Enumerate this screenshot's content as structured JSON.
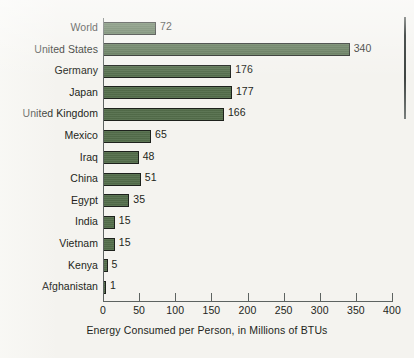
{
  "chart_data": {
    "type": "bar",
    "orientation": "horizontal",
    "title": "",
    "xlabel": "Energy Consumed per Person, in Millions of BTUs",
    "ylabel": "",
    "xlim": [
      0,
      400
    ],
    "xticks": [
      0,
      50,
      100,
      150,
      200,
      250,
      300,
      350,
      400
    ],
    "grid": false,
    "legend": "none",
    "bar_color": "#546e4b",
    "bar_border_color": "#1d211c",
    "background_color": "#f4f3ef",
    "text_color": "#231f20",
    "categories": [
      "World",
      "United States",
      "Germany",
      "Japan",
      "United Kingdom",
      "Mexico",
      "Iraq",
      "China",
      "Egypt",
      "India",
      "Vietnam",
      "Kenya",
      "Afghanistan"
    ],
    "values": [
      72,
      340,
      176,
      177,
      166,
      65,
      48,
      51,
      35,
      15,
      15,
      5,
      1
    ],
    "data_labels": [
      "72",
      "340",
      "176",
      "177",
      "166",
      "65",
      "48",
      "51",
      "35",
      "15",
      "15",
      "5",
      "1"
    ],
    "tick_labels": [
      "0",
      "50",
      "100",
      "150",
      "200",
      "250",
      "300",
      "350",
      "400"
    ]
  }
}
